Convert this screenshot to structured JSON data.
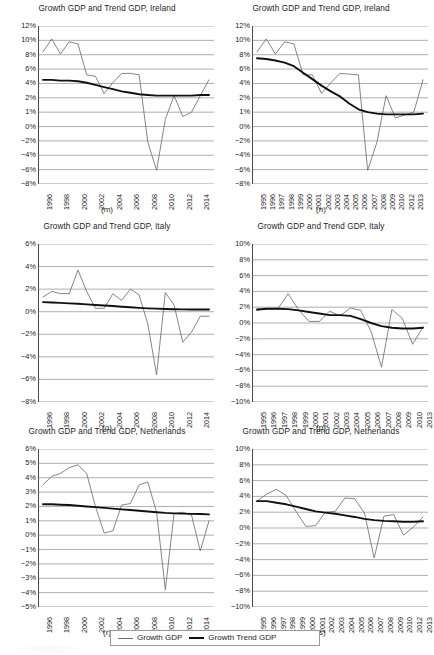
{
  "figure": {
    "width": 428,
    "height": 655,
    "background": "#ffffff",
    "series_colors": {
      "growth_gdp": "#6f6f6f",
      "growth_trend_gdp": "#111111",
      "gridline": "#8c8c8c",
      "axis": "#4a4a4a"
    }
  },
  "legend": {
    "entries": [
      {
        "label": "Growth GDP",
        "style": "thin-line",
        "color": "#6f6f6f"
      },
      {
        "label": "Growth Trend GDP",
        "style": "thick-line",
        "color": "#111111"
      }
    ]
  },
  "chart_data": [
    {
      "id": "m",
      "type": "line",
      "title": "Growth GDP and Trend GDP, Ireland",
      "caption": "(m)",
      "xlabel": "",
      "ylabel": "",
      "grid": true,
      "legend_position": "figure-bottom",
      "ylim": [
        -8,
        12
      ],
      "yticks": [
        12,
        10,
        8,
        6,
        4,
        2,
        1,
        0,
        -2,
        -4,
        -6,
        -8
      ],
      "yticklabels": [
        "12%",
        "10%",
        "8%",
        "6%",
        "4%",
        "2%",
        "1%",
        "0%",
        "-2%",
        "-4%",
        "-6%",
        "-8%"
      ],
      "x": [
        1996,
        1997,
        1998,
        1999,
        2000,
        2001,
        2002,
        2003,
        2004,
        2005,
        2006,
        2007,
        2008,
        2009,
        2010,
        2011,
        2012,
        2013,
        2014,
        2015
      ],
      "xticklabels": [
        "1996",
        "1998",
        "2000",
        "2002",
        "2004",
        "2006",
        "2008",
        "2010",
        "2012",
        "2014"
      ],
      "xtickvalues": [
        1996,
        1998,
        2000,
        2002,
        2004,
        2006,
        2008,
        2010,
        2012,
        2014
      ],
      "series": [
        {
          "name": "Growth GDP",
          "values": [
            8.4,
            10.2,
            8.1,
            9.8,
            9.5,
            5.2,
            5.0,
            2.6,
            4.1,
            5.4,
            5.4,
            5.2,
            -2.2,
            -6.1,
            0.5,
            2.3,
            0.7,
            1.0,
            2.3,
            4.5
          ]
        },
        {
          "name": "Growth Trend GDP",
          "values": [
            4.5,
            4.5,
            4.4,
            4.4,
            4.3,
            4.1,
            3.8,
            3.5,
            3.2,
            2.9,
            2.7,
            2.5,
            2.4,
            2.3,
            2.3,
            2.3,
            2.3,
            2.3,
            2.4,
            2.4
          ]
        }
      ]
    },
    {
      "id": "n",
      "type": "line",
      "title": "Growth GDP and Trend GDP, Ireland",
      "caption": "(n)",
      "xlabel": "",
      "ylabel": "",
      "grid": true,
      "legend_position": "figure-bottom",
      "ylim": [
        -8,
        12
      ],
      "yticks": [
        12,
        10,
        8,
        6,
        4,
        2,
        1,
        0,
        -2,
        -4,
        -6,
        -8
      ],
      "yticklabels": [
        "12%",
        "10%",
        "8%",
        "6%",
        "4%",
        "2%",
        "1%",
        "0%",
        "-2%",
        "-4%",
        "-6%",
        "-8%"
      ],
      "x": [
        1995,
        1996,
        1997,
        1998,
        1999,
        2000,
        2001,
        2002,
        2003,
        2004,
        2005,
        2006,
        2007,
        2008,
        2009,
        2010,
        2011,
        2012,
        2013
      ],
      "xticklabels": [
        "1995",
        "1996",
        "1997",
        "1998",
        "1999",
        "2000",
        "2001",
        "2002",
        "2003",
        "2004",
        "2005",
        "2006",
        "2007",
        "2008",
        "2009",
        "2010",
        "2012",
        "2013"
      ],
      "series": [
        {
          "name": "Growth GDP",
          "values": [
            8.4,
            10.2,
            8.1,
            9.8,
            9.5,
            5.2,
            5.2,
            2.6,
            4.1,
            5.4,
            5.3,
            5.2,
            -6.1,
            -2.2,
            2.3,
            0.6,
            0.8,
            1.0,
            4.5
          ]
        },
        {
          "name": "Growth Trend GDP",
          "values": [
            7.5,
            7.4,
            7.2,
            6.9,
            6.4,
            5.5,
            4.6,
            3.7,
            2.9,
            2.2,
            1.6,
            1.2,
            1.0,
            0.9,
            0.85,
            0.85,
            0.85,
            0.85,
            0.9
          ]
        }
      ]
    },
    {
      "id": "o",
      "type": "line",
      "title": "Growth GDP and Trend GDP, Italy",
      "caption": "(o)",
      "xlabel": "",
      "ylabel": "",
      "grid": true,
      "legend_position": "figure-bottom",
      "ylim": [
        -8,
        6
      ],
      "yticks": [
        6,
        4,
        2,
        0,
        -2,
        -4,
        -6,
        -8
      ],
      "yticklabels": [
        "6%",
        "4%",
        "2%",
        "0%",
        "-2%",
        "-4%",
        "-6%",
        "-8%"
      ],
      "x": [
        1996,
        1997,
        1998,
        1999,
        2000,
        2001,
        2002,
        2003,
        2004,
        2005,
        2006,
        2007,
        2008,
        2009,
        2010,
        2011,
        2012,
        2013,
        2014,
        2015
      ],
      "xticklabels": [
        "1996",
        "1998",
        "2000",
        "2002",
        "2004",
        "2006",
        "2008",
        "2010",
        "2012",
        "2014"
      ],
      "xtickvalues": [
        1996,
        1998,
        2000,
        2002,
        2004,
        2006,
        2008,
        2010,
        2012,
        2014
      ],
      "series": [
        {
          "name": "Growth GDP",
          "values": [
            1.3,
            1.8,
            1.6,
            1.6,
            3.7,
            1.8,
            0.3,
            0.3,
            1.6,
            1.0,
            2.0,
            1.5,
            -1.1,
            -5.6,
            1.7,
            0.6,
            -2.7,
            -1.8,
            -0.4,
            -0.4
          ]
        },
        {
          "name": "Growth Trend GDP",
          "values": [
            0.85,
            0.82,
            0.78,
            0.74,
            0.7,
            0.65,
            0.6,
            0.55,
            0.5,
            0.44,
            0.39,
            0.34,
            0.3,
            0.27,
            0.24,
            0.22,
            0.21,
            0.2,
            0.2,
            0.2
          ]
        }
      ]
    },
    {
      "id": "p",
      "type": "line",
      "title": "Growth GDP and Trend GDP, Italy",
      "caption": "(p)",
      "xlabel": "",
      "ylabel": "",
      "grid": true,
      "legend_position": "figure-bottom",
      "ylim": [
        -10,
        10
      ],
      "yticks": [
        10,
        8,
        6,
        4,
        2,
        0,
        -2,
        -4,
        -6,
        -8,
        -10
      ],
      "yticklabels": [
        "10%",
        "8%",
        "6%",
        "4%",
        "2%",
        "0%",
        "-2%",
        "-4%",
        "-6%",
        "-8%",
        "-10%"
      ],
      "x": [
        1995,
        1996,
        1997,
        1998,
        1999,
        2000,
        2001,
        2002,
        2003,
        2004,
        2005,
        2006,
        2007,
        2008,
        2009,
        2010,
        2013
      ],
      "xticklabels": [
        "1995",
        "1996",
        "1997",
        "1998",
        "1999",
        "2000",
        "2001",
        "2002",
        "2003",
        "2004",
        "2005",
        "2006",
        "2007",
        "2008",
        "2009",
        "2010",
        "2013"
      ],
      "series": [
        {
          "name": "Growth GDP",
          "values": [
            1.6,
            1.8,
            1.8,
            3.7,
            1.7,
            0.2,
            0.2,
            1.5,
            0.9,
            1.9,
            1.6,
            -1.1,
            -5.6,
            1.7,
            0.6,
            -2.7,
            -0.5
          ]
        },
        {
          "name": "Growth Trend GDP",
          "values": [
            1.7,
            1.8,
            1.8,
            1.75,
            1.6,
            1.4,
            1.2,
            1.0,
            1.0,
            0.9,
            0.5,
            0.0,
            -0.4,
            -0.6,
            -0.7,
            -0.7,
            -0.6
          ]
        }
      ]
    },
    {
      "id": "r",
      "type": "line",
      "title": "Growth GDP and Trend GDP, Netherlands",
      "caption": "(r)",
      "xlabel": "",
      "ylabel": "",
      "grid": true,
      "legend_position": "figure-bottom",
      "ylim": [
        -5,
        6
      ],
      "yticks": [
        6,
        5,
        4,
        3,
        2,
        1,
        0,
        -1,
        -2,
        -3,
        -4,
        -5
      ],
      "yticklabels": [
        "6%",
        "5%",
        "4%",
        "3%",
        "2%",
        "1%",
        "0%",
        "-1%",
        "-2%",
        "-3%",
        "-4%",
        "-5%"
      ],
      "x": [
        1996,
        1997,
        1998,
        1999,
        2000,
        2001,
        2002,
        2003,
        2004,
        2005,
        2006,
        2007,
        2008,
        2009,
        2010,
        2011,
        2012,
        2013,
        2014,
        2015
      ],
      "xticklabels": [
        "1996",
        "1998",
        "2000",
        "2002",
        "2004",
        "2006",
        "2008",
        "2010",
        "2012",
        "2014"
      ],
      "xtickvalues": [
        1996,
        1998,
        2000,
        2002,
        2004,
        2006,
        2008,
        2010,
        2012,
        2014
      ],
      "series": [
        {
          "name": "Growth GDP",
          "values": [
            3.5,
            4.1,
            4.3,
            4.7,
            4.9,
            4.3,
            2.0,
            0.15,
            0.3,
            2.1,
            2.2,
            3.5,
            3.7,
            1.6,
            -3.8,
            1.5,
            1.6,
            1.4,
            -1.1,
            1.0
          ]
        },
        {
          "name": "Growth Trend GDP",
          "values": [
            2.15,
            2.15,
            2.12,
            2.1,
            2.05,
            2.0,
            1.95,
            1.9,
            1.85,
            1.8,
            1.75,
            1.7,
            1.65,
            1.6,
            1.55,
            1.52,
            1.5,
            1.48,
            1.47,
            1.45
          ]
        }
      ]
    },
    {
      "id": "s",
      "type": "line",
      "title": "Growth GDP and Trend GDP, Netherlands",
      "caption": "(s)",
      "xlabel": "",
      "ylabel": "",
      "grid": true,
      "legend_position": "figure-bottom",
      "ylim": [
        -10,
        10
      ],
      "yticks": [
        10,
        8,
        6,
        4,
        2,
        0,
        -2,
        -4,
        -6,
        -8,
        -10
      ],
      "yticklabels": [
        "10%",
        "8%",
        "6%",
        "4%",
        "2%",
        "0%",
        "-2%",
        "-4%",
        "-6%",
        "-8%",
        "-10%"
      ],
      "x": [
        1995,
        1996,
        1997,
        1998,
        1999,
        2000,
        2001,
        2002,
        2003,
        2004,
        2005,
        2006,
        2007,
        2008,
        2009,
        2010,
        2012,
        2013
      ],
      "xticklabels": [
        "1995",
        "1996",
        "1997",
        "1998",
        "1999",
        "2000",
        "2001",
        "2002",
        "2003",
        "2004",
        "2005",
        "2006",
        "2007",
        "2008",
        "2009",
        "2010",
        "2012",
        "2013"
      ],
      "series": [
        {
          "name": "Growth GDP",
          "values": [
            3.4,
            4.3,
            4.9,
            4.1,
            2.1,
            0.2,
            0.3,
            2.0,
            2.1,
            3.8,
            3.7,
            1.9,
            -3.8,
            1.5,
            1.7,
            -0.9,
            0.1,
            1.4
          ]
        },
        {
          "name": "Growth Trend GDP",
          "values": [
            3.4,
            3.4,
            3.2,
            3.0,
            2.7,
            2.4,
            2.1,
            1.95,
            1.8,
            1.6,
            1.4,
            1.15,
            1.0,
            0.9,
            0.85,
            0.8,
            0.8,
            0.85
          ]
        }
      ]
    }
  ]
}
